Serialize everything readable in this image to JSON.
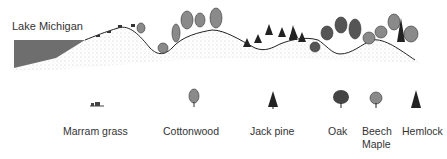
{
  "lake_label": "Lake Michigan",
  "legend": [
    {
      "label": "Marram grass",
      "icon": "marram-grass-icon",
      "x": 63,
      "icon_x": 92
    },
    {
      "label": "Cottonwood",
      "icon": "cottonwood-icon",
      "x": 163,
      "icon_x": 194
    },
    {
      "label": "Jack pine",
      "icon": "jack-pine-icon",
      "x": 250,
      "icon_x": 272
    },
    {
      "label": "Oak",
      "icon": "oak-icon",
      "x": 328,
      "icon_x": 340
    },
    {
      "label": "Beech\nMaple",
      "line1": "Beech",
      "line2": "Maple",
      "icon": "beech-maple-icon",
      "x": 362,
      "icon_x": 375
    },
    {
      "label": "Hemlock",
      "icon": "hemlock-icon",
      "x": 402,
      "icon_x": 415
    }
  ],
  "colors": {
    "water": "#6e6e6e",
    "tree_fill": "#8a8a8a",
    "tree_dark": "#2b2b2b",
    "ground_line": "#222222",
    "sand_stipple": "#9a9a9a"
  }
}
